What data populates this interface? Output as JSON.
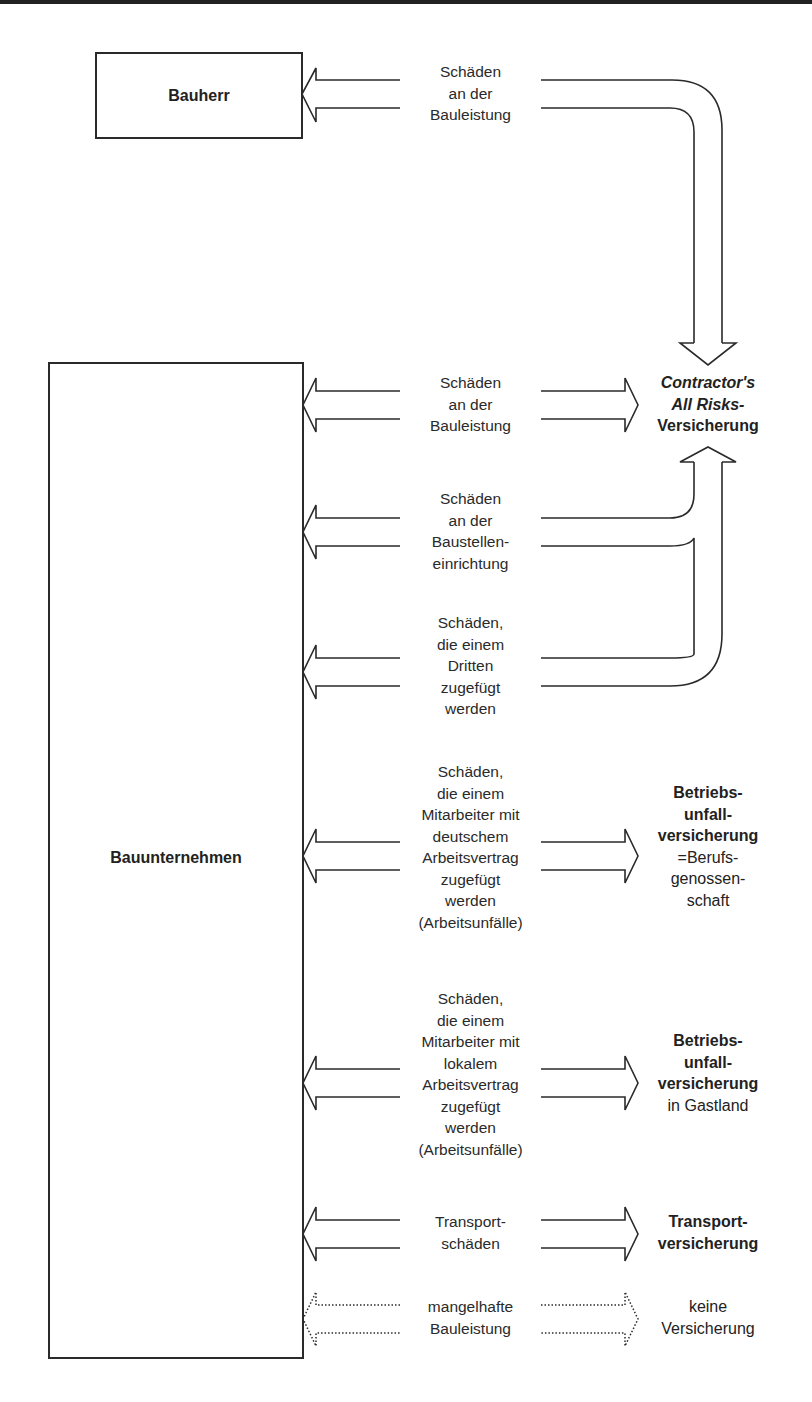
{
  "diagram": {
    "parties": {
      "client": "Bauherr",
      "contractor": "Bauunternehmen"
    },
    "flows": [
      {
        "id": "bauherr-bauleistung",
        "from": "Bauherr",
        "label_lines": [
          "Schäden",
          "an der",
          "Bauleistung"
        ],
        "to": "Contractor's All Risks-Versicherung",
        "style": "solid"
      },
      {
        "id": "bauleistung",
        "from": "Bauunternehmen",
        "label_lines": [
          "Schäden",
          "an der",
          "Bauleistung"
        ],
        "to": "Contractor's All Risks-Versicherung",
        "style": "solid"
      },
      {
        "id": "baustelleneinrichtung",
        "from": "Bauunternehmen",
        "label_lines": [
          "Schäden",
          "an der",
          "Baustellen-",
          "einrichtung"
        ],
        "to": "Contractor's All Risks-Versicherung",
        "style": "solid"
      },
      {
        "id": "dritte",
        "from": "Bauunternehmen",
        "label_lines": [
          "Schäden,",
          "die einem",
          "Dritten",
          "zugefügt",
          "werden"
        ],
        "to": "Contractor's All Risks-Versicherung",
        "style": "solid"
      },
      {
        "id": "mitarbeiter-deutsch",
        "from": "Bauunternehmen",
        "label_lines": [
          "Schäden,",
          "die einem",
          "Mitarbeiter mit",
          "deutschem",
          "Arbeitsvertrag",
          "zugefügt",
          "werden",
          "(Arbeitsunfälle)"
        ],
        "to": "Betriebsunfallversicherung =Berufsgenossenschaft",
        "style": "solid"
      },
      {
        "id": "mitarbeiter-lokal",
        "from": "Bauunternehmen",
        "label_lines": [
          "Schäden,",
          "die einem",
          "Mitarbeiter mit",
          "lokalem",
          "Arbeitsvertrag",
          "zugefügt",
          "werden",
          "(Arbeitsunfälle)"
        ],
        "to": "Betriebsunfallversicherung in Gastland",
        "style": "solid"
      },
      {
        "id": "transport",
        "from": "Bauunternehmen",
        "label_lines": [
          "Transport-",
          "schäden"
        ],
        "to": "Transportversicherung",
        "style": "solid"
      },
      {
        "id": "mangelhaft",
        "from": "Bauunternehmen",
        "label_lines": [
          "mangelhafte",
          "Bauleistung"
        ],
        "to": "keine Versicherung",
        "style": "dotted"
      }
    ],
    "insurances": {
      "car": {
        "line1": "Contractor's",
        "line2": "All Risks-",
        "line3": "Versicherung"
      },
      "bg": {
        "line1": "Betriebs-",
        "line2": "unfall-",
        "line3": "versicherung",
        "line4": "=Berufs-",
        "line5": "genossen-",
        "line6": "schaft"
      },
      "gast": {
        "line1": "Betriebs-",
        "line2": "unfall-",
        "line3": "versicherung",
        "line4": "in Gastland"
      },
      "transport": {
        "line1": "Transport-",
        "line2": "versicherung"
      },
      "none": {
        "line1": "keine",
        "line2": "Versicherung"
      }
    },
    "colors": {
      "stroke": "#2a2a2a",
      "background": "#ffffff"
    }
  }
}
